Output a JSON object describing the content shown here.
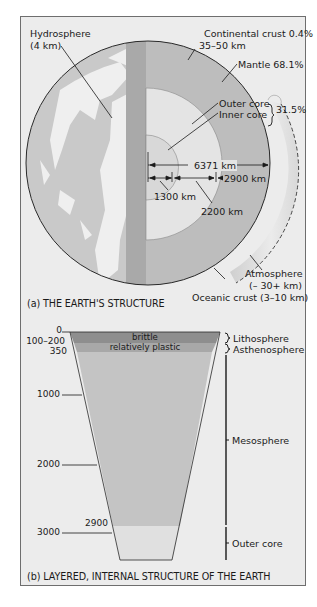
{
  "part_a": {
    "caption": "(a) THE EARTH'S STRUCTURE",
    "labels": {
      "hydrosphere": "Hydrosphere",
      "hydrosphere_thickness": "(4 km)",
      "continental_crust": "Continental crust 0.4%",
      "continental_crust_thickness": "35–50 km",
      "mantle": "Mantle 68.1%",
      "outer_core": "Outer core",
      "inner_core": "Inner core",
      "core_percent": "31.5%",
      "radius": "6371 km",
      "mantle_depth": "2900 km",
      "inner_core_radius": "1300 km",
      "outer_core_thickness": "2200 km",
      "atmosphere": "Atmosphere",
      "atmosphere_thickness": "(– 30+ km)",
      "oceanic_crust": "Oceanic crust (3–10 km)"
    },
    "colors": {
      "ocean": "#c9c9c9",
      "land": "#f0f0f0",
      "crust_band": "#a9a9a9",
      "mantle": "#bdbdbd",
      "outer_core": "#e2e2e2",
      "inner_core": "#d6d6d6",
      "atmosphere": "#dcdcdc"
    }
  },
  "part_b": {
    "caption": "(b) LAYERED, INTERNAL STRUCTURE OF THE EARTH",
    "depth_ticks": [
      {
        "label": "0"
      },
      {
        "label": "100–200"
      },
      {
        "label": "350"
      },
      {
        "label": "1000"
      },
      {
        "label": "2000"
      },
      {
        "label": "2900"
      },
      {
        "label": "3000"
      }
    ],
    "bands": {
      "brittle": "brittle",
      "plastic": "relatively plastic"
    },
    "layers": {
      "lithosphere": "Lithosphere",
      "asthenosphere": "Asthenosphere",
      "mesosphere": "Mesosphere",
      "outer_core": "Outer core"
    },
    "colors": {
      "lithosphere": "#8e8e8e",
      "asthenosphere": "#a8a8a8",
      "mesosphere": "#c4c4c4",
      "outer_core": "#e0e0e0"
    }
  }
}
